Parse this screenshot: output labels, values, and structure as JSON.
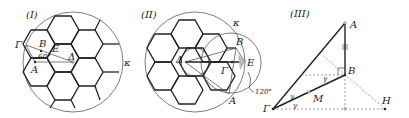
{
  "figures": [
    {
      "id": "I",
      "title": "(I)",
      "labels": {
        "gamma": "Γ",
        "b": "B",
        "e": "E",
        "delta": "Δ",
        "a": "A",
        "kappa": "κ",
        "angle": "60°"
      }
    },
    {
      "id": "II",
      "title": "(II)",
      "labels": {
        "kappa": "κ",
        "b": "B",
        "delta": "Δ",
        "e": "E",
        "gamma": "Γ",
        "a": "A",
        "angle": "120°"
      }
    },
    {
      "id": "III",
      "title": "(III)",
      "labels": {
        "a": "A",
        "b": "B",
        "gamma_vertex": "Γ",
        "m": "M",
        "h": "H",
        "gamma1": "γ",
        "gamma2": "γ",
        "gamma3": "γ"
      }
    }
  ]
}
